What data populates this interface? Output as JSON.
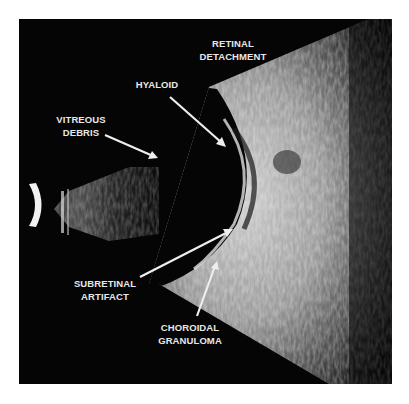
{
  "figure": {
    "type": "ocular B-scan ultrasound",
    "background_color": "#050505",
    "label_color": "#e8e8e8",
    "labels": [
      {
        "id": "retinal-detachment",
        "line1": "RETINAL",
        "line2": "DETACHMENT"
      },
      {
        "id": "hyaloid",
        "line1": "HYALOID",
        "line2": ""
      },
      {
        "id": "vitreous-debris",
        "line1": "VITREOUS",
        "line2": "DEBRIS"
      },
      {
        "id": "subretinal-artifact",
        "line1": "SUBRETINAL",
        "line2": "ARTIFACT"
      },
      {
        "id": "choroidal-granuloma",
        "line1": "CHOROIDAL",
        "line2": "GRANULOMA"
      }
    ]
  }
}
